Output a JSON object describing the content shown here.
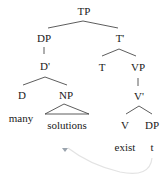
{
  "diagram": {
    "type": "syntax-tree",
    "nodes": {
      "tp": "TP",
      "dp": "DP",
      "t_bar": "T'",
      "d_bar": "D'",
      "t": "T",
      "vp": "VP",
      "d": "D",
      "np": "NP",
      "v_bar": "V'",
      "v": "V",
      "dp_obj": "DP"
    },
    "words": {
      "many": "many",
      "solutions": "solutions",
      "exist": "exist",
      "trace": "t"
    },
    "colors": {
      "text": "#1a1a1a",
      "branch": "#333333",
      "movement_arrow": "#e6e6e6",
      "arrowhead": "#9aa3ad"
    }
  }
}
